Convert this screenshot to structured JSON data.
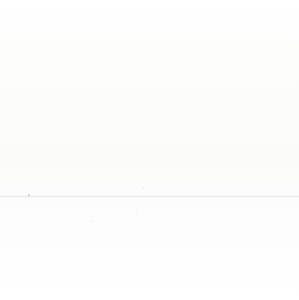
{
  "figure": {
    "background_color": "#fcfcfb",
    "shape": "circle",
    "divider_color": "#ffffff",
    "ring_color": "#ffffff",
    "label_color": "#2b2b2b"
  },
  "chart_data": {
    "type": "pie",
    "title": "",
    "subtitle": "",
    "xlabel": "",
    "ylabel": "",
    "legend_position": "none",
    "grid": false,
    "labels_inside_slices": true,
    "total_slices": 6,
    "equal_slices": true,
    "slice_angle_degrees": 60,
    "categories": [
      "Fear",
      "Joy",
      "Surprise",
      "Love",
      "Sadness",
      "Anger"
    ],
    "values": [
      1,
      1,
      1,
      1,
      1,
      1
    ],
    "percentages": [
      16.7,
      16.7,
      16.7,
      16.7,
      16.7,
      16.7
    ],
    "colors": [
      "#a8a8a8",
      "#dcdcdc",
      "#8f8f8f",
      "#c6c6c6",
      "#d2d2d2",
      "#a5a5a5"
    ],
    "slices": [
      {
        "label": "Fear",
        "value": 1,
        "percent": 16.7,
        "color": "#a8a8a8",
        "start_angle": 0,
        "end_angle": 60,
        "position": "top-right"
      },
      {
        "label": "Joy",
        "value": 1,
        "percent": 16.7,
        "color": "#dcdcdc",
        "start_angle": 60,
        "end_angle": 120,
        "position": "right"
      },
      {
        "label": "Surprise",
        "value": 1,
        "percent": 16.7,
        "color": "#8f8f8f",
        "start_angle": 120,
        "end_angle": 180,
        "position": "bottom-right"
      },
      {
        "label": "Love",
        "value": 1,
        "percent": 16.7,
        "color": "#c6c6c6",
        "start_angle": 180,
        "end_angle": 240,
        "position": "bottom-left"
      },
      {
        "label": "Sadness",
        "value": 1,
        "percent": 16.7,
        "color": "#d2d2d2",
        "start_angle": 240,
        "end_angle": 300,
        "position": "left"
      },
      {
        "label": "Anger",
        "value": 1,
        "percent": 16.7,
        "color": "#a5a5a5",
        "start_angle": 300,
        "end_angle": 360,
        "position": "top-left"
      }
    ]
  }
}
